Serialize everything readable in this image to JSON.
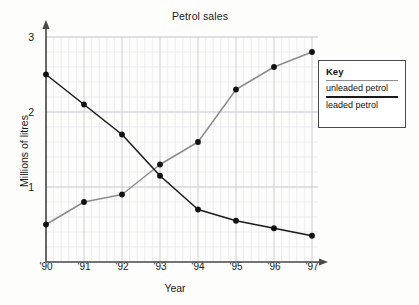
{
  "chart_data": {
    "type": "line",
    "title": "Petrol sales",
    "xlabel": "Year",
    "ylabel": "Millions of litres",
    "categories": [
      "'90",
      "'91",
      "'92",
      "'93",
      "'94",
      "'95",
      "'96",
      "'97"
    ],
    "x": [
      1990,
      1991,
      1992,
      1993,
      1994,
      1995,
      1996,
      1997
    ],
    "series": [
      {
        "name": "unleaded petrol",
        "color": "#8c8c8c",
        "values": [
          0.5,
          0.8,
          0.9,
          1.3,
          1.6,
          2.3,
          2.6,
          2.8
        ]
      },
      {
        "name": "leaded petrol",
        "color": "#1a1a1a",
        "values": [
          2.5,
          2.1,
          1.7,
          1.15,
          0.7,
          0.55,
          0.45,
          0.35
        ]
      }
    ],
    "ylim": [
      0,
      3
    ],
    "yticks": [
      1,
      2,
      3
    ],
    "ytick_labels": [
      "1",
      "2",
      "3"
    ],
    "xlim": [
      1990,
      1997
    ],
    "grid": true,
    "minor_grid": true,
    "minor_divisions": 5,
    "legend_position": "right-outside",
    "marker": "filled-circle"
  },
  "legend": {
    "title": "Key",
    "entries": [
      {
        "label": "unleaded petrol",
        "color": "#8c8c8c"
      },
      {
        "label": "leaded petrol",
        "color": "#1a1a1a"
      }
    ]
  },
  "axes": {
    "y_tick_1": "1",
    "y_tick_2": "2",
    "y_tick_3": "3",
    "x_tick_0": "'90",
    "x_tick_1": "'91",
    "x_tick_2": "'92",
    "x_tick_3": "'93",
    "x_tick_4": "'94",
    "x_tick_5": "'95",
    "x_tick_6": "'96",
    "x_tick_7": "'97"
  },
  "colors": {
    "background": "#fdfdfc",
    "axis": "#4a4a4a",
    "major_grid": "#c9c9cf",
    "minor_grid": "#e2e2e8",
    "unleaded": "#8c8c8c",
    "leaded": "#1a1a1a"
  }
}
